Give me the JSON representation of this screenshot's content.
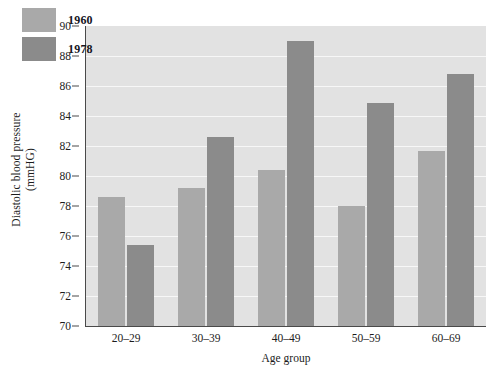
{
  "chart_data": {
    "type": "bar",
    "title": "",
    "xlabel": "Age group",
    "ylabel_line1": "Diastolic blood pressure",
    "ylabel_line2": "(mmHG)",
    "categories": [
      "20–29",
      "30–39",
      "40–49",
      "50–59",
      "60–69"
    ],
    "series": [
      {
        "name": "1960",
        "values": [
          78.6,
          79.2,
          80.4,
          78.0,
          81.7
        ],
        "color": "#a9a9a9"
      },
      {
        "name": "1978",
        "values": [
          75.4,
          82.6,
          89.0,
          84.9,
          86.8
        ],
        "color": "#8b8b8b"
      }
    ],
    "ylim": [
      70,
      90
    ],
    "yticks": [
      70,
      72,
      74,
      76,
      78,
      80,
      82,
      84,
      86,
      88,
      90
    ],
    "ytick_labels": [
      "70",
      "72",
      "74",
      "76",
      "78",
      "80",
      "82",
      "84",
      "86",
      "88",
      "90"
    ],
    "grid": true,
    "gridlines_at": [
      72,
      74,
      76,
      78,
      80,
      82,
      84,
      86,
      88
    ],
    "legend_position": "top-left-inside",
    "plot_background": "#e2e2e2",
    "gridline_color": "#f7f7f7",
    "axis_color": "#4a4a4a",
    "figure_background": "#ffffff"
  },
  "legend": {
    "items": [
      {
        "label": "1960",
        "color": "#a9a9a9"
      },
      {
        "label": "1978",
        "color": "#8b8b8b"
      }
    ]
  }
}
